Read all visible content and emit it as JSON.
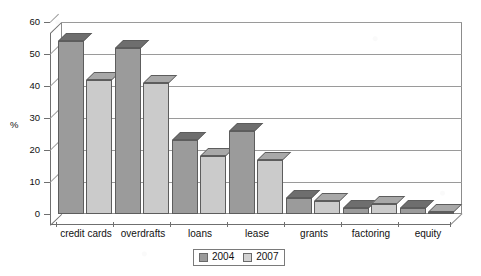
{
  "chart_data": {
    "type": "bar",
    "title": "",
    "subtitle": "",
    "xlabel": "",
    "ylabel": "%",
    "ylim": [
      0,
      60
    ],
    "yticks": [
      0,
      10,
      20,
      30,
      40,
      50,
      60
    ],
    "grid": true,
    "three_d": true,
    "legend_position": "bottom-center",
    "categories": [
      "credit cards",
      "overdrafts",
      "loans",
      "lease",
      "grants",
      "factoring",
      "equity"
    ],
    "series": [
      {
        "name": "2004",
        "color": "#9b9b9b",
        "values": [
          54,
          52,
          23,
          26,
          5,
          2,
          2
        ]
      },
      {
        "name": "2007",
        "color": "#cbcbcb",
        "values": [
          42,
          41,
          18,
          17,
          4,
          3,
          0.5
        ]
      }
    ]
  },
  "axis": {
    "y_label": "%",
    "y_tick_labels": [
      "60",
      "50",
      "40",
      "30",
      "20",
      "10",
      "0"
    ]
  },
  "legend": {
    "items": [
      {
        "label": "2004",
        "swatch": "dark-gray"
      },
      {
        "label": "2007",
        "swatch": "light-gray"
      }
    ]
  }
}
